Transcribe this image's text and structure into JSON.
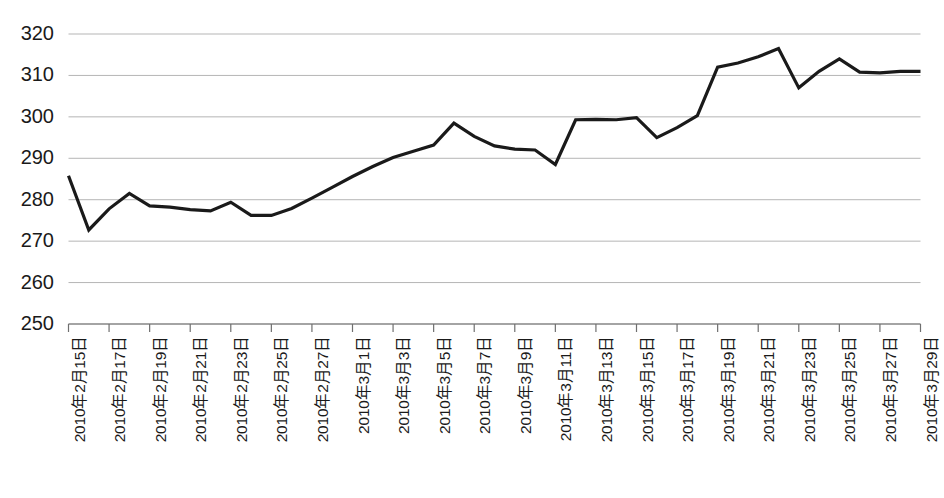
{
  "chart_data": {
    "type": "line",
    "title": "",
    "subtitle": "",
    "xlabel": "",
    "ylabel": "",
    "ylim": [
      250,
      320
    ],
    "yticks": [
      250,
      260,
      270,
      280,
      290,
      300,
      310,
      320
    ],
    "ytick_labels": [
      "250",
      "260",
      "270",
      "280",
      "290",
      "300",
      "310",
      "320"
    ],
    "grid": true,
    "grid_axis": "y",
    "legend": false,
    "legend_position": "none",
    "line_color": "#1a1a1a",
    "line_width": 3.2,
    "gridline_color": "#b5b5b5",
    "axis_color": "#6f6f6f",
    "background_color": "#ffffff",
    "xtick_labels": [
      "2010年2月15日",
      "2010年2月17日",
      "2010年2月19日",
      "2010年2月21日",
      "2010年2月23日",
      "2010年2月25日",
      "2010年2月27日",
      "2010年3月1日",
      "2010年3月3日",
      "2010年3月5日",
      "2010年3月7日",
      "2010年3月9日",
      "2010年3月11日",
      "2010年3月13日",
      "2010年3月15日",
      "2010年3月17日",
      "2010年3月19日",
      "2010年3月21日",
      "2010年3月23日",
      "2010年3月25日",
      "2010年3月27日",
      "2010年3月29日"
    ],
    "x": [
      "2010年2月15日",
      "2010年2月16日",
      "2010年2月17日",
      "2010年2月18日",
      "2010年2月19日",
      "2010年2月20日",
      "2010年2月21日",
      "2010年2月22日",
      "2010年2月23日",
      "2010年2月24日",
      "2010年2月25日",
      "2010年2月26日",
      "2010年2月27日",
      "2010年2月28日",
      "2010年3月1日",
      "2010年3月2日",
      "2010年3月3日",
      "2010年3月4日",
      "2010年3月5日",
      "2010年3月6日",
      "2010年3月7日",
      "2010年3月8日",
      "2010年3月9日",
      "2010年3月10日",
      "2010年3月11日",
      "2010年3月12日",
      "2010年3月13日",
      "2010年3月14日",
      "2010年3月15日",
      "2010年3月16日",
      "2010年3月17日",
      "2010年3月18日",
      "2010年3月19日",
      "2010年3月20日",
      "2010年3月21日",
      "2010年3月22日",
      "2010年3月23日",
      "2010年3月24日",
      "2010年3月25日",
      "2010年3月26日",
      "2010年3月27日",
      "2010年3月28日",
      "2010年3月29日"
    ],
    "values": [
      285.8,
      272.7,
      277.8,
      281.5,
      278.5,
      278.2,
      277.6,
      277.3,
      279.4,
      276.2,
      276.2,
      277.9,
      280.4,
      283.0,
      285.6,
      288.0,
      290.2,
      291.7,
      293.2,
      298.5,
      295.3,
      293.0,
      292.2,
      292.0,
      288.5,
      299.3,
      299.4,
      299.3,
      299.8,
      295.0,
      297.4,
      300.3,
      312.0,
      313.0,
      314.5,
      316.5,
      307.0,
      311.0,
      314.0,
      310.8,
      310.6,
      311.0,
      311.0
    ]
  }
}
